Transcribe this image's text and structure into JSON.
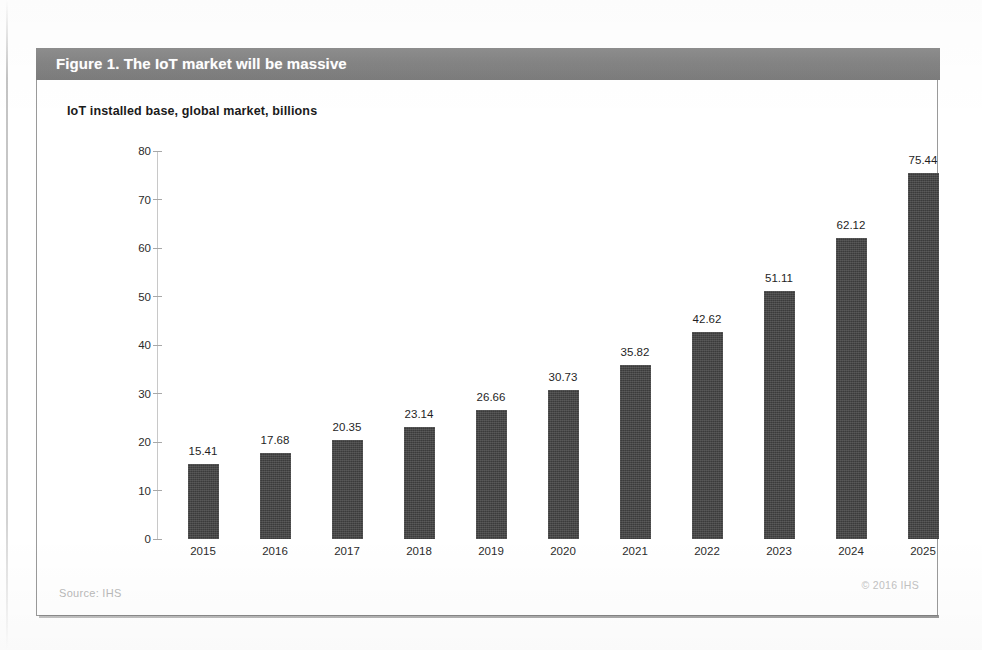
{
  "figure": {
    "banner_title": "Figure 1. The IoT market will be massive",
    "subtitle": "IoT installed base, global market, billions",
    "source": "Source: IHS",
    "copyright": "© 2016 IHS",
    "banner_color": "#848484",
    "bar_color": "#3b3b3b",
    "card_border_color": "#9a9a9a"
  },
  "chart_data": {
    "type": "bar",
    "title": "Figure 1. The IoT market will be massive",
    "subtitle": "IoT installed base, global market, billions",
    "xlabel": "",
    "ylabel": "",
    "ylim": [
      0,
      80
    ],
    "yticks": [
      0,
      10,
      20,
      30,
      40,
      50,
      60,
      70,
      80
    ],
    "ytick_labels": [
      "0",
      "10",
      "20",
      "30",
      "40",
      "50",
      "60",
      "70",
      "80"
    ],
    "grid": false,
    "legend": false,
    "data_labels": true,
    "categories": [
      "2015",
      "2016",
      "2017",
      "2018",
      "2019",
      "2020",
      "2021",
      "2022",
      "2023",
      "2024",
      "2025"
    ],
    "values": [
      15.41,
      17.68,
      20.35,
      23.14,
      26.66,
      30.73,
      35.82,
      42.62,
      51.11,
      62.12,
      75.44
    ],
    "value_labels": [
      "15.41",
      "17.68",
      "20.35",
      "23.14",
      "26.66",
      "30.73",
      "35.82",
      "42.62",
      "51.11",
      "62.12",
      "75.44"
    ]
  }
}
